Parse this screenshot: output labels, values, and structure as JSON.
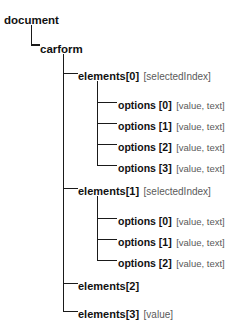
{
  "diagram": {
    "background_color": "#ffffff",
    "line_color": "#1a1a1a",
    "name_color": "#111111",
    "annotation_color": "#5a5a5a",
    "nodes": [
      {
        "id": "document",
        "name": "document",
        "annot": "",
        "depth": 0,
        "x": 4,
        "y": 11
      },
      {
        "id": "carform",
        "name": "carform",
        "annot": "",
        "depth": 1,
        "x": 40,
        "y": 40
      },
      {
        "id": "elements0",
        "name": "elements[0]",
        "annot": "[selectedIndex]",
        "depth": 2,
        "x": 78,
        "y": 67
      },
      {
        "id": "el0-opt0",
        "name": "options [0]",
        "annot": "[value, text]",
        "depth": 3,
        "x": 118,
        "y": 96
      },
      {
        "id": "el0-opt1",
        "name": "options [1]",
        "annot": "[value, text]",
        "depth": 3,
        "x": 118,
        "y": 117
      },
      {
        "id": "el0-opt2",
        "name": "options [2]",
        "annot": "[value, text]",
        "depth": 3,
        "x": 118,
        "y": 138
      },
      {
        "id": "el0-opt3",
        "name": "options [3]",
        "annot": "[value, text]",
        "depth": 3,
        "x": 118,
        "y": 159
      },
      {
        "id": "elements1",
        "name": "elements[1]",
        "annot": "[selectedIndex]",
        "depth": 2,
        "x": 78,
        "y": 182
      },
      {
        "id": "el1-opt0",
        "name": "options [0]",
        "annot": "[value, text]",
        "depth": 3,
        "x": 118,
        "y": 212
      },
      {
        "id": "el1-opt1",
        "name": "options [1]",
        "annot": "[value, text]",
        "depth": 3,
        "x": 118,
        "y": 233
      },
      {
        "id": "el1-opt2",
        "name": "options [2]",
        "annot": "[value, text]",
        "depth": 3,
        "x": 118,
        "y": 254
      },
      {
        "id": "elements2",
        "name": "elements[2]",
        "annot": "",
        "depth": 2,
        "x": 78,
        "y": 277
      },
      {
        "id": "elements3",
        "name": "elements[3]",
        "annot": "[value]",
        "depth": 2,
        "x": 78,
        "y": 305
      }
    ],
    "connectors": {
      "document_to_carform": {
        "trunk_x": 31,
        "top_y": 25,
        "elbow_y": 45,
        "stop_x": 39
      },
      "carform_trunk": {
        "trunk_x": 63,
        "top_y": 54,
        "bottom_y": 311,
        "stop_x": 77
      },
      "carform_branch_ys": [
        73,
        188,
        283,
        311
      ],
      "el0_options_trunk": {
        "trunk_x": 97,
        "top_y": 81,
        "bottom_y": 165,
        "stop_x": 116
      },
      "el0_branch_ys": [
        102,
        123,
        144,
        165
      ],
      "el1_options_trunk": {
        "trunk_x": 97,
        "top_y": 196,
        "bottom_y": 260,
        "stop_x": 116
      },
      "el1_branch_ys": [
        218,
        239,
        260
      ]
    }
  }
}
